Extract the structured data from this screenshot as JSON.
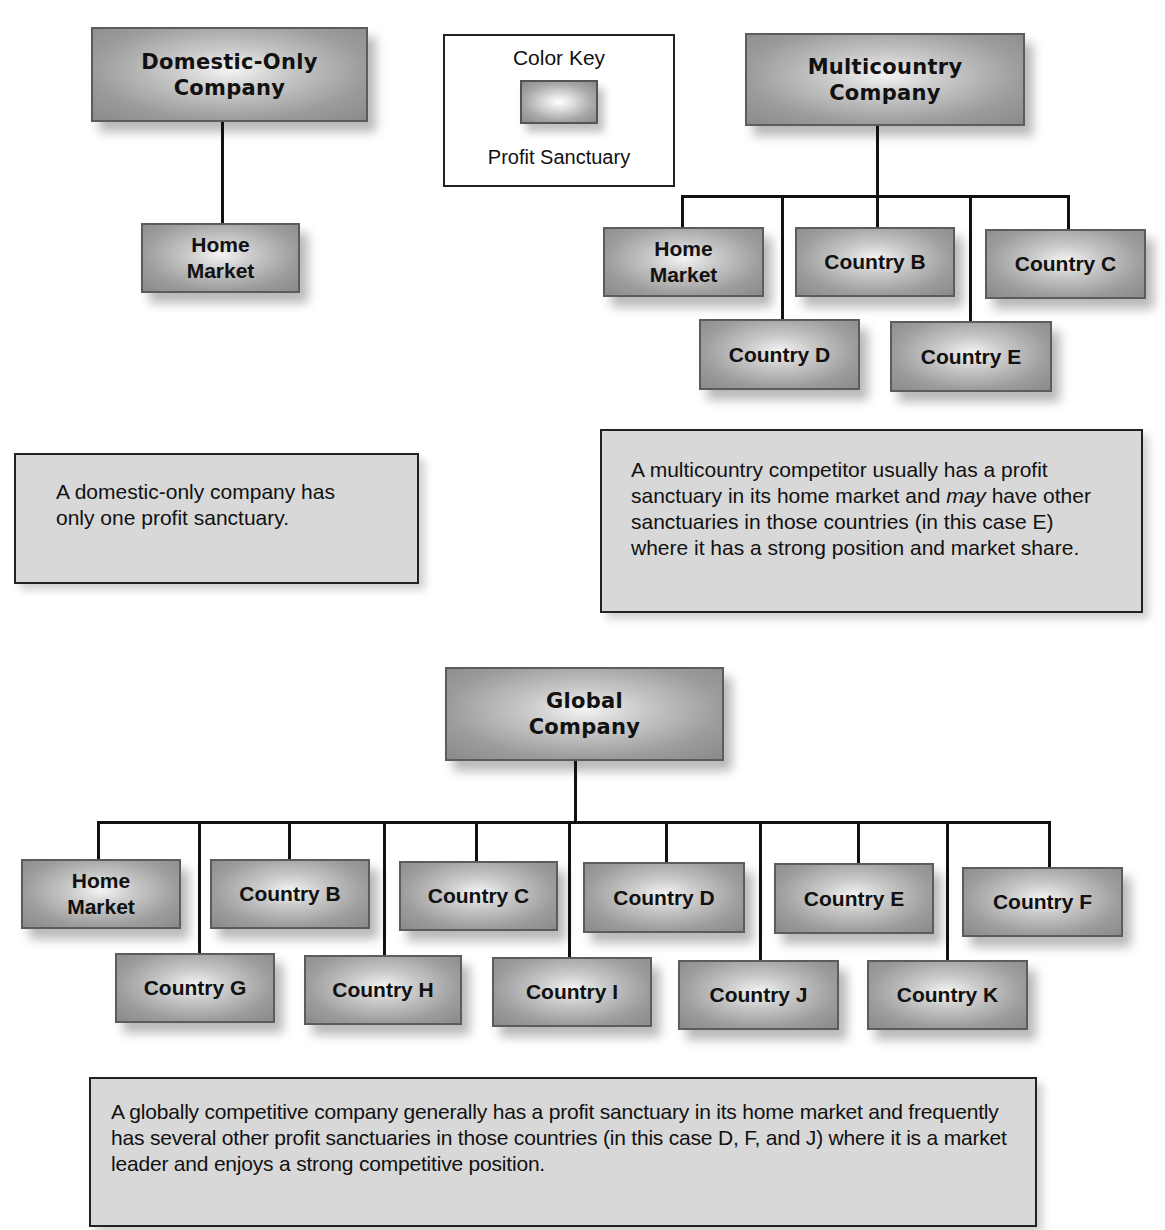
{
  "color_key": {
    "title": "Color Key",
    "swatch_label": "Profit Sanctuary"
  },
  "domestic": {
    "head": "Domestic-Only\nCompany",
    "children": [
      "Home\nMarket"
    ],
    "note": "A domestic-only company has only one profit sanctuary."
  },
  "multicountry": {
    "head": "Multicountry\nCompany",
    "children": [
      "Home\nMarket",
      "Country B",
      "Country C",
      "Country D",
      "Country E"
    ],
    "note_parts": {
      "line1": "A multicountry competitor usually has a profit sanctuary in its home market and ",
      "emphasis": "may",
      "line2": " have other sanctuaries in those countries (in this case E) where it has a strong position and market share."
    }
  },
  "global": {
    "head": "Global\nCompany",
    "children": [
      "Home\nMarket",
      "Country B",
      "Country C",
      "Country D",
      "Country E",
      "Country F",
      "Country G",
      "Country H",
      "Country I",
      "Country J",
      "Country K"
    ],
    "note": "A globally competitive company generally has a profit sanctuary in its home market and frequently has several other profit sanctuaries in those countries (in this case D, F, and J) where it is a market leader and enjoys a strong competitive position."
  },
  "colors": {
    "box_fill": "#9c9c9c",
    "box_highlight": "#f4f4f4",
    "note_fill": "#d8d8d8",
    "line": "#111111"
  }
}
